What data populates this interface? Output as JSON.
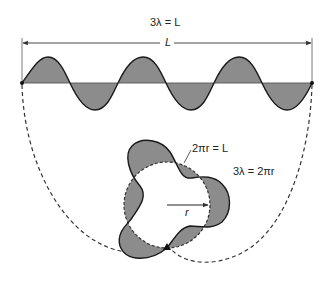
{
  "diagram": {
    "title_equation": "3λ = L",
    "length_label": "L",
    "circumference_equation": "2πr = L",
    "standing_wave_condition": "3λ = 2πr",
    "radius_label": "r",
    "wavelengths": 3,
    "colors": {
      "wave_fill": "#8c8c8c",
      "stroke": "#1a1a1a",
      "axis_line": "#555555",
      "background": "#ffffff"
    }
  }
}
